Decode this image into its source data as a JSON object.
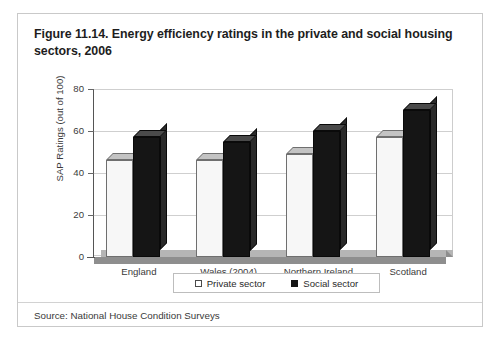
{
  "figure": {
    "title": "Figure 11.14. Energy efficiency ratings in the private and social housing sectors, 2006",
    "source": "Source: National House Condition Surveys"
  },
  "chart_data": {
    "type": "bar",
    "title": "Figure 11.14. Energy efficiency ratings in the private and social housing sectors, 2006",
    "xlabel": "",
    "ylabel": "SAP Ratings (out of 100)",
    "ylim": [
      0,
      80
    ],
    "yticks": [
      0,
      20,
      40,
      60,
      80
    ],
    "ytick_labels": [
      "0",
      "20",
      "40",
      "60",
      "80"
    ],
    "grid": true,
    "legend_position": "bottom",
    "style": "3d-column",
    "categories": [
      "England",
      "Wales (2004)",
      "Northern Ireland",
      "Scotland"
    ],
    "series": [
      {
        "name": "Private sector",
        "color": "#f7f7f7",
        "values": [
          46,
          46,
          49,
          57
        ]
      },
      {
        "name": "Social sector",
        "color": "#151515",
        "values": [
          57,
          55,
          60,
          70
        ]
      }
    ]
  },
  "legend": {
    "items": [
      {
        "label": "Private sector",
        "swatch": "open-square-icon"
      },
      {
        "label": "Social sector",
        "swatch": "filled-square-icon"
      }
    ]
  }
}
